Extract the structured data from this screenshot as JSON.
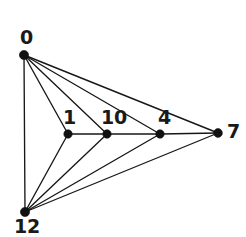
{
  "figure": {
    "kind": "node-link-graph-diagram",
    "width": 246,
    "height": 237,
    "background_color": "#ffffff",
    "stroke_color": "#171717",
    "node_color": "#111111",
    "label_color": "#1a1a1a"
  },
  "chart_data": {
    "type": "diagram",
    "title": "",
    "xlabel": "",
    "ylabel": "",
    "graph_type": "undirected planar graph",
    "node_count": 6,
    "edge_count": 12,
    "nodes": [
      {
        "id": "0",
        "label": "0",
        "x": 24,
        "y": 55,
        "r": 4.6,
        "label_x": 20,
        "label_y": 28,
        "label_anchor": "above-left"
      },
      {
        "id": "1",
        "label": "1",
        "x": 68,
        "y": 134,
        "r": 4.2,
        "label_x": 63,
        "label_y": 108,
        "label_anchor": "above"
      },
      {
        "id": "10",
        "label": "10",
        "x": 107,
        "y": 134,
        "r": 4.2,
        "label_x": 101,
        "label_y": 108,
        "label_anchor": "above"
      },
      {
        "id": "4",
        "label": "4",
        "x": 160,
        "y": 134,
        "r": 4.2,
        "label_x": 158,
        "label_y": 108,
        "label_anchor": "above"
      },
      {
        "id": "7",
        "label": "7",
        "x": 218,
        "y": 133,
        "r": 4.4,
        "label_x": 227,
        "label_y": 122,
        "label_anchor": "right"
      },
      {
        "id": "12",
        "label": "12",
        "x": 25,
        "y": 212,
        "r": 4.6,
        "label_x": 14,
        "label_y": 217,
        "label_anchor": "below"
      }
    ],
    "edges": [
      {
        "source": "0",
        "target": "12"
      },
      {
        "source": "0",
        "target": "1"
      },
      {
        "source": "0",
        "target": "10"
      },
      {
        "source": "0",
        "target": "4"
      },
      {
        "source": "0",
        "target": "7"
      },
      {
        "source": "12",
        "target": "1"
      },
      {
        "source": "12",
        "target": "10"
      },
      {
        "source": "12",
        "target": "4"
      },
      {
        "source": "12",
        "target": "7"
      },
      {
        "source": "1",
        "target": "10"
      },
      {
        "source": "10",
        "target": "4"
      },
      {
        "source": "4",
        "target": "7"
      }
    ]
  }
}
